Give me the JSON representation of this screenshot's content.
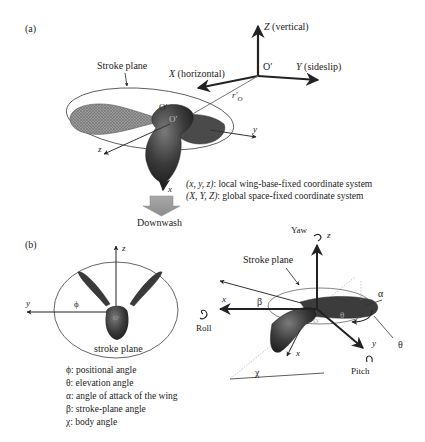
{
  "panel_a": {
    "label": "(a)",
    "stroke_plane_label": "Stroke plane",
    "origin_label": "O′",
    "origin_label_wing": "O′",
    "global_axes": {
      "Z": "Z",
      "Z_desc": "(vertical)",
      "Y": "Y",
      "Y_desc": "(sideslip)",
      "X": "X",
      "X_desc": "(horizontal)",
      "origin": "O′",
      "r_vector": "r′",
      "r_subscript": "O"
    },
    "local_axes": {
      "x": "x",
      "y": "y",
      "z": "z"
    },
    "downwash_label": "Downwash",
    "legend": [
      {
        "symbol": "(x, y, z)",
        "text": ": local wing-base-fixed coordinate system"
      },
      {
        "symbol": "(X, Y, Z)",
        "text": ": global space-fixed coordinate system"
      }
    ]
  },
  "panel_b": {
    "label": "(b)",
    "front_view": {
      "z_axis": "z",
      "y_axis": "y",
      "phi": "ϕ",
      "origin": "O′",
      "stroke_plane_label": "stroke plane"
    },
    "side_view": {
      "yaw_label": "Yaw",
      "z_axis": "z",
      "stroke_plane_label": "Stroke plane",
      "x_axis": "x",
      "x_body": "x",
      "y_axis": "y",
      "roll_label": "Roll",
      "pitch_label": "Pitch",
      "beta": "β",
      "alpha": "α",
      "theta": "θ",
      "theta_outer": "θ",
      "chi": "χ",
      "origin": "O′"
    },
    "angle_definitions": [
      {
        "symbol": "ϕ",
        "text": ": positional angle"
      },
      {
        "symbol": "θ",
        "text": ": elevation angle"
      },
      {
        "symbol": "α",
        "text": ": angle of attack of the wing"
      },
      {
        "symbol": "β",
        "text": ": stroke-plane angle"
      },
      {
        "symbol": "χ",
        "text": ": body angle"
      }
    ]
  },
  "colors": {
    "ink": "#222222",
    "body_dark": "#3a3a3a",
    "wing_gray": "#8a8a8a",
    "downwash_gray": "#9a9a9a",
    "ellipse": "#555555"
  }
}
